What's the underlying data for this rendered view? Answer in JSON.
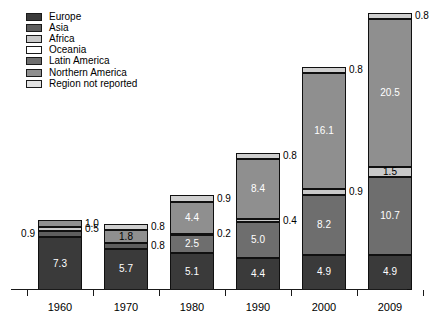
{
  "legend": {
    "items": [
      {
        "label": "Europe",
        "color": "#3a3a3a"
      },
      {
        "label": "Asia",
        "color": "#5e5e5e"
      },
      {
        "label": "Africa",
        "color": "#c9c9c9"
      },
      {
        "label": "Oceania",
        "color": "#ffffff"
      },
      {
        "label": "Latin America",
        "color": "#6e6e6e"
      },
      {
        "label": "Northern America",
        "color": "#8f8f8f"
      },
      {
        "label": "Region not reported",
        "color": "#e2e2e2"
      }
    ]
  },
  "chart_data": {
    "type": "bar",
    "subtype": "stacked",
    "title": "",
    "xlabel": "",
    "ylabel": "",
    "ylim": [
      0,
      38.5
    ],
    "grid": false,
    "legend_position": "top-left",
    "categories": [
      "1960",
      "1970",
      "1980",
      "1990",
      "2000",
      "2009"
    ],
    "series": [
      {
        "name": "Europe",
        "color": "#3a3a3a",
        "values": [
          7.3,
          5.7,
          5.1,
          4.4,
          4.9,
          4.9
        ]
      },
      {
        "name": "Asia",
        "color": "#5e5e5e",
        "values": [
          0.9,
          0.8,
          2.5,
          5.0,
          8.2,
          10.7
        ]
      },
      {
        "name": "Africa",
        "color": "#c9c9c9",
        "values": [
          0.5,
          0.8,
          0.2,
          0.4,
          0.9,
          1.5
        ]
      },
      {
        "name": "Northern America",
        "color": "#8f8f8f",
        "values": [
          1.0,
          1.8,
          4.4,
          8.4,
          16.1,
          20.5
        ]
      },
      {
        "name": "Region not reported",
        "color": "#cfcfcf",
        "values": [
          0.0,
          0.8,
          0.9,
          0.8,
          0.8,
          0.8
        ]
      }
    ],
    "bars": [
      {
        "category": "1960",
        "total": 9.7,
        "segments": [
          {
            "series": "Europe",
            "value": 7.3,
            "color": "#3a3a3a",
            "label": "7.3",
            "label_pos": "inside",
            "label_style": "on-dark"
          },
          {
            "series": "Asia",
            "value": 0.9,
            "color": "#5e5e5e",
            "label": "0.9",
            "label_pos": "left",
            "label_style": "callout"
          },
          {
            "series": "Africa",
            "value": 0.5,
            "color": "#c9c9c9",
            "label": "0.5",
            "label_pos": "right",
            "label_style": "callout"
          },
          {
            "series": "Northern America",
            "value": 1.0,
            "color": "#8f8f8f",
            "label": "1.0",
            "label_pos": "right",
            "label_style": "callout"
          }
        ]
      },
      {
        "category": "1970",
        "total": 9.1,
        "segments": [
          {
            "series": "Europe",
            "value": 5.7,
            "color": "#3a3a3a",
            "label": "5.7",
            "label_pos": "inside",
            "label_style": "on-dark"
          },
          {
            "series": "Asia",
            "value": 0.8,
            "color": "#5e5e5e",
            "label": "0.8",
            "label_pos": "right",
            "label_style": "callout"
          },
          {
            "series": "Northern America",
            "value": 1.8,
            "color": "#8f8f8f",
            "label": "1.8",
            "label_pos": "inside",
            "label_style": "on-light"
          },
          {
            "series": "Region not reported",
            "value": 0.8,
            "color": "#cfcfcf",
            "label": "0.8",
            "label_pos": "right",
            "label_style": "callout"
          }
        ]
      },
      {
        "category": "1980",
        "total": 13.1,
        "segments": [
          {
            "series": "Europe",
            "value": 5.1,
            "color": "#3a3a3a",
            "label": "5.1",
            "label_pos": "inside",
            "label_style": "on-dark"
          },
          {
            "series": "Asia",
            "value": 2.5,
            "color": "#6e6e6e",
            "label": "2.5",
            "label_pos": "inside",
            "label_style": "on-dark"
          },
          {
            "series": "Africa",
            "value": 0.2,
            "color": "#c9c9c9",
            "label": "0.2",
            "label_pos": "right",
            "label_style": "callout"
          },
          {
            "series": "Northern America",
            "value": 4.4,
            "color": "#8f8f8f",
            "label": "4.4",
            "label_pos": "inside",
            "label_style": "on-dark"
          },
          {
            "series": "Region not reported",
            "value": 0.9,
            "color": "#cfcfcf",
            "label": "0.9",
            "label_pos": "right",
            "label_style": "callout"
          }
        ]
      },
      {
        "category": "1990",
        "total": 19.0,
        "segments": [
          {
            "series": "Europe",
            "value": 4.4,
            "color": "#3a3a3a",
            "label": "4.4",
            "label_pos": "inside",
            "label_style": "on-dark"
          },
          {
            "series": "Asia",
            "value": 5.0,
            "color": "#6e6e6e",
            "label": "5.0",
            "label_pos": "inside",
            "label_style": "on-dark"
          },
          {
            "series": "Africa",
            "value": 0.4,
            "color": "#c9c9c9",
            "label": "0.4",
            "label_pos": "right",
            "label_style": "callout"
          },
          {
            "series": "Northern America",
            "value": 8.4,
            "color": "#8f8f8f",
            "label": "8.4",
            "label_pos": "inside",
            "label_style": "on-dark"
          },
          {
            "series": "Region not reported",
            "value": 0.8,
            "color": "#cfcfcf",
            "label": "0.8",
            "label_pos": "right",
            "label_style": "callout"
          }
        ]
      },
      {
        "category": "2000",
        "total": 30.9,
        "segments": [
          {
            "series": "Europe",
            "value": 4.9,
            "color": "#3a3a3a",
            "label": "4.9",
            "label_pos": "inside",
            "label_style": "on-dark"
          },
          {
            "series": "Asia",
            "value": 8.2,
            "color": "#6e6e6e",
            "label": "8.2",
            "label_pos": "inside",
            "label_style": "on-dark"
          },
          {
            "series": "Africa",
            "value": 0.9,
            "color": "#c9c9c9",
            "label": "0.9",
            "label_pos": "right",
            "label_style": "callout"
          },
          {
            "series": "Northern America",
            "value": 16.1,
            "color": "#8f8f8f",
            "label": "16.1",
            "label_pos": "inside",
            "label_style": "on-dark"
          },
          {
            "series": "Region not reported",
            "value": 0.8,
            "color": "#cfcfcf",
            "label": "0.8",
            "label_pos": "right",
            "label_style": "callout"
          }
        ]
      },
      {
        "category": "2009",
        "total": 38.4,
        "segments": [
          {
            "series": "Europe",
            "value": 4.9,
            "color": "#3a3a3a",
            "label": "4.9",
            "label_pos": "inside",
            "label_style": "on-dark"
          },
          {
            "series": "Asia",
            "value": 10.7,
            "color": "#6e6e6e",
            "label": "10.7",
            "label_pos": "inside",
            "label_style": "on-dark"
          },
          {
            "series": "Africa",
            "value": 1.5,
            "color": "#c9c9c9",
            "label": "1.5",
            "label_pos": "inside",
            "label_style": "on-light"
          },
          {
            "series": "Northern America",
            "value": 20.5,
            "color": "#8f8f8f",
            "label": "20.5",
            "label_pos": "inside",
            "label_style": "on-dark"
          },
          {
            "series": "Region not reported",
            "value": 0.8,
            "color": "#cfcfcf",
            "label": "0.8",
            "label_pos": "right",
            "label_style": "callout"
          }
        ]
      }
    ]
  },
  "axis": {
    "tick_labels": [
      "1960",
      "1970",
      "1980",
      "1990",
      "2000",
      "2009"
    ]
  }
}
